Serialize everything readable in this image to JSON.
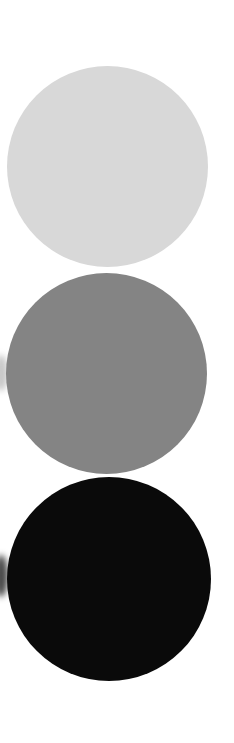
{
  "canvas": {
    "width": 234,
    "height": 743,
    "background": "#ffffff"
  },
  "circles": [
    {
      "name": "light-gray",
      "color": "#d8d8d8",
      "left": 7,
      "top": 66,
      "diameter": 201
    },
    {
      "name": "medium-gray",
      "color": "#848484",
      "left": 6,
      "top": 273,
      "diameter": 201
    },
    {
      "name": "black",
      "color": "#0a0a0a",
      "left": 7,
      "top": 477,
      "diameter": 204
    }
  ],
  "smudges": [
    {
      "color": "#c8c8c8",
      "top": 355,
      "height": 36
    },
    {
      "color": "#4a4a4a",
      "top": 555,
      "height": 42
    }
  ]
}
